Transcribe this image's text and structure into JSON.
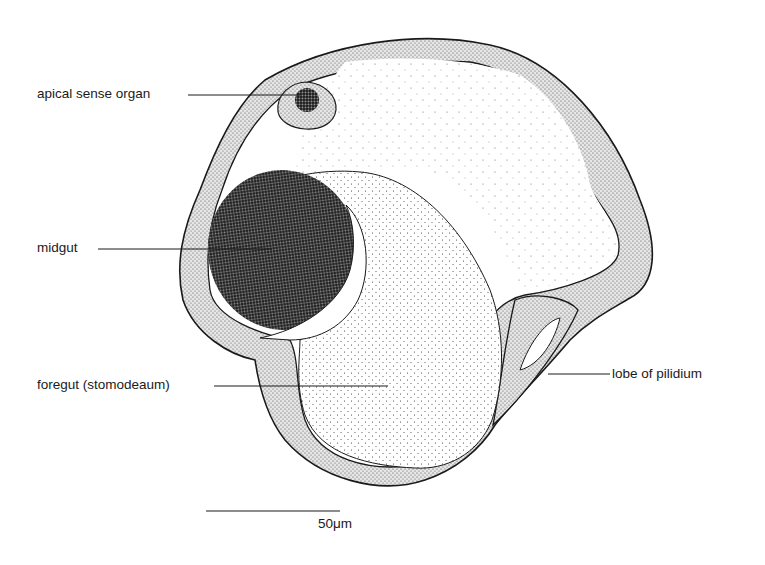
{
  "figure": {
    "labels": {
      "apical": "apical sense organ",
      "midgut": "midgut",
      "foregut": "foregut (stomodeaum)",
      "lobe": "lobe of pilidium"
    },
    "scale_bar": {
      "label": "50μm"
    }
  },
  "colors": {
    "ink": "#1a1a1a",
    "background": "#ffffff"
  }
}
